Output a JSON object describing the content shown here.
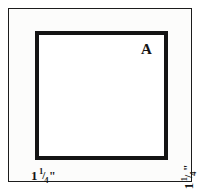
{
  "figure": {
    "shape_type": "square",
    "shape_label": "A",
    "colors": {
      "stroke": "#141414",
      "frame_stroke": "#1c1c1c",
      "fill": "#ffffff",
      "paper": "#fcfcfb",
      "text": "#141414"
    },
    "dimensions": [
      {
        "name": "bottom-side",
        "position": "bottom",
        "orientation": "horizontal",
        "whole": "1",
        "numerator": "1",
        "bar": "/",
        "denominator": "4",
        "unit": "\"",
        "full_text": "1 1/4\""
      },
      {
        "name": "right-side",
        "position": "right",
        "orientation": "vertical",
        "whole": "1",
        "numerator": "1",
        "bar": "/",
        "denominator": "4",
        "unit": "\"",
        "full_text": "1 1/4\""
      }
    ]
  }
}
